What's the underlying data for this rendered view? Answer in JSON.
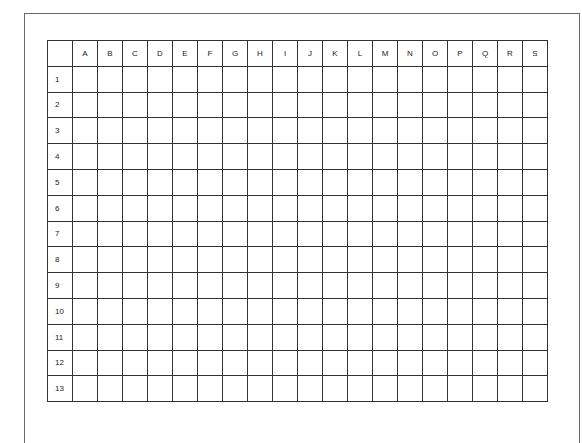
{
  "grid": {
    "columns": [
      "A",
      "B",
      "C",
      "D",
      "E",
      "F",
      "G",
      "H",
      "I",
      "J",
      "K",
      "L",
      "M",
      "N",
      "O",
      "P",
      "Q",
      "R",
      "S"
    ],
    "rows": [
      "1",
      "2",
      "3",
      "4",
      "5",
      "6",
      "7",
      "8",
      "9",
      "10",
      "11",
      "12",
      "13"
    ],
    "corner_label": ""
  },
  "colors": {
    "grid_line": "#333333",
    "frame_line": "#6a6a6a",
    "text": "#222222",
    "background": "#ffffff"
  }
}
